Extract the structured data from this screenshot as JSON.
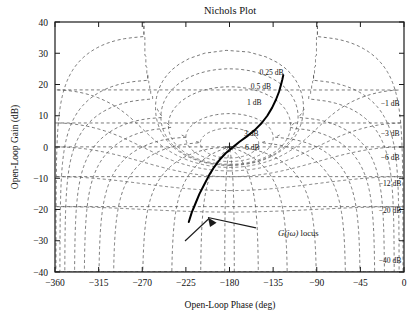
{
  "chart_data": {
    "type": "line",
    "title": "Nichols Plot",
    "xlabel": "Open-Loop Phase (deg)",
    "ylabel": "Open-Loop Gain (dB)",
    "xlim": [
      -360,
      0
    ],
    "ylim": [
      -40,
      40
    ],
    "xticks": [
      -360,
      -315,
      -270,
      -225,
      -180,
      -135,
      -90,
      -45,
      0
    ],
    "xticklabels": [
      "−360",
      "−315",
      "−270",
      "−225",
      "−180",
      "−135",
      "−90",
      "−45",
      "0"
    ],
    "yticks": [
      -40,
      -30,
      -20,
      -10,
      0,
      10,
      20,
      30,
      40
    ],
    "yticklabels": [
      "−40",
      "−30",
      "−20",
      "−10",
      "0",
      "10",
      "20",
      "30",
      "40"
    ],
    "grid": "nichols-m-n-contours",
    "legend": "none",
    "series": [
      {
        "name": "G(jω) locus",
        "points": [
          [
            -222,
            -24.0
          ],
          [
            -219,
            -21.0
          ],
          [
            -215,
            -18.0
          ],
          [
            -211,
            -15.0
          ],
          [
            -206,
            -12.0
          ],
          [
            -201,
            -9.0
          ],
          [
            -196,
            -6.5
          ],
          [
            -190,
            -4.0
          ],
          [
            -184,
            -2.0
          ],
          [
            -177,
            -0.2
          ],
          [
            -170,
            1.6
          ],
          [
            -162,
            3.4
          ],
          [
            -154,
            5.4
          ],
          [
            -147,
            7.6
          ],
          [
            -141,
            10.0
          ],
          [
            -136,
            12.6
          ],
          [
            -132,
            15.2
          ],
          [
            -129,
            17.6
          ],
          [
            -127,
            19.8
          ],
          [
            -125.5,
            21.6
          ],
          [
            -124.5,
            23.0
          ]
        ]
      }
    ],
    "annotations": [
      {
        "name": "critical-point",
        "text": "+",
        "x": -180,
        "y": 0
      },
      {
        "name": "locus-annotation",
        "text": "G(jω) locus",
        "x": -130,
        "y": -27.5
      }
    ],
    "m_contour_labels_inner": [
      {
        "label": "0.25 dB",
        "x": -149,
        "y": 23.0
      },
      {
        "label": "0.5 dB",
        "x": -158,
        "y": 18.5
      },
      {
        "label": "1 dB",
        "x": -162,
        "y": 13.5
      },
      {
        "label": "3 dB",
        "x": -165,
        "y": 3.6
      },
      {
        "label": "6 dB",
        "x": -164,
        "y": -0.8
      }
    ],
    "m_contour_labels_right": [
      {
        "label": "−1 dB",
        "x": -24,
        "y": 13.2
      },
      {
        "label": "−3 dB",
        "x": -24,
        "y": 3.4
      },
      {
        "label": "−6 dB",
        "x": -24,
        "y": -4.0
      },
      {
        "label": "−12 dB",
        "x": -26,
        "y": -12.6
      },
      {
        "label": "−20 dB",
        "x": -26,
        "y": -21.0
      },
      {
        "label": "−40 dB",
        "x": -26,
        "y": -37.2
      }
    ]
  },
  "style": {
    "background": "#ffffff",
    "axis_color": "#1a1a1a",
    "grid_color": "#4d4d4d",
    "locus_color": "#000000"
  }
}
